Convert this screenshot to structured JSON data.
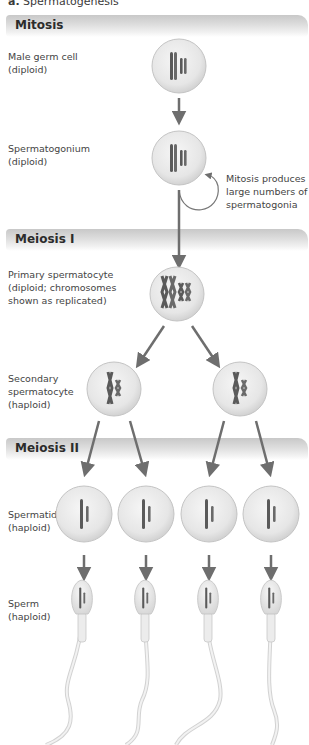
{
  "figure": {
    "panel_letter": "a.",
    "title": "Spermatogenesis"
  },
  "phases": [
    {
      "name": "Mitosis",
      "top": 15
    },
    {
      "name": "Meiosis I",
      "top": 229
    },
    {
      "name": "Meiosis II",
      "top": 438
    }
  ],
  "stages": [
    {
      "label": "Male germ cell\n(diploid)",
      "top": 50,
      "cell_count": 1,
      "ploidy": "diploid"
    },
    {
      "label": "Spermatogonium\n(diploid)",
      "top": 142,
      "cell_count": 1,
      "ploidy": "diploid"
    },
    {
      "label": "Primary spermatocyte\n(diploid; chromosomes\nshown as replicated)",
      "top": 268,
      "cell_count": 1,
      "ploidy": "diploid"
    },
    {
      "label": "Secondary\nspermatocyte\n(haploid)",
      "top": 372,
      "cell_count": 2,
      "ploidy": "haploid"
    },
    {
      "label": "Spermatid\n(haploid)",
      "top": 508,
      "cell_count": 4,
      "ploidy": "haploid"
    },
    {
      "label": "Sperm\n(haploid)",
      "top": 597,
      "cell_count": 4,
      "ploidy": "haploid"
    }
  ],
  "annotations": {
    "mitosis_loop": "Mitosis produces\nlarge numbers of\nspermatogonia"
  },
  "colors": {
    "arrow": "#6e6e6e",
    "cell_fill": "#ececec",
    "cell_edge": "#c4c4c4",
    "chromosome": "#5a5a5a",
    "banner": "#d6d6d6"
  }
}
